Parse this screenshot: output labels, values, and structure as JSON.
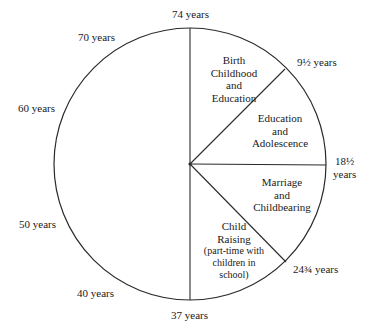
{
  "diagram": {
    "type": "life-cycle pie",
    "ring_labels": {
      "top": "74 years",
      "seventy": "70 years",
      "sixty": "60 years",
      "fifty": "50 years",
      "forty": "40 years",
      "bottom": "37 years",
      "nine_half": "9½ years",
      "eighteen_half_num": "18½",
      "eighteen_half_unit": "years",
      "twentyfour_3q": "24¾ years"
    },
    "segments": [
      {
        "lines": [
          "Birth",
          "Childhood",
          "and",
          "Education"
        ]
      },
      {
        "lines": [
          "Education",
          "and",
          "Adolescence"
        ]
      },
      {
        "lines": [
          "Marriage",
          "and",
          "Childbearing"
        ]
      },
      {
        "lines": [
          "Child",
          "Raising",
          "(part-time with",
          "children in",
          "school)"
        ]
      }
    ],
    "colors": {
      "line": "#2a2a2a",
      "background": "#ffffff",
      "text": "#1a1a1a"
    }
  }
}
